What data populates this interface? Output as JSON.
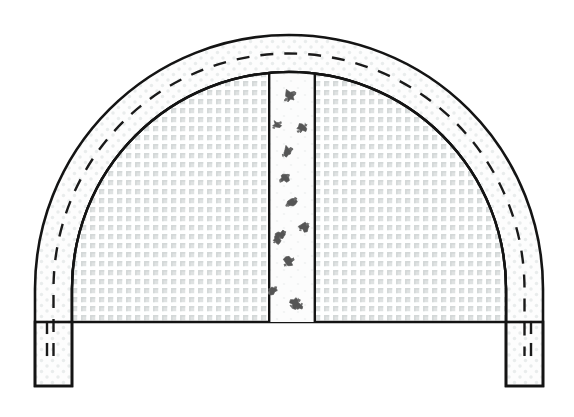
{
  "figure": {
    "title": "Tunnel Arch Cross-Section",
    "domain": "Diagram",
    "width": 574,
    "height": 417,
    "background_color": "#ffffff",
    "line_color": "#141414"
  },
  "geometry": {
    "outer_arch": {
      "name": "outer-lining-ring",
      "apex_y": 34,
      "left_outer_x": 35,
      "right_outer_x": 543,
      "left_inner_x": 72,
      "right_inner_x": 506,
      "springline_y": 322,
      "base_y": 386,
      "band_thickness": 37,
      "fill_color": "#fbfbfb",
      "stroke_width": 2.6
    },
    "dashed_centerline": {
      "name": "lining-centerline",
      "offset_from_outer": 12,
      "dash_pattern": "13 11",
      "stroke_width": 2.4,
      "color": "#1a1a1a"
    },
    "inner_core": {
      "name": "excavation-core",
      "apex_y": 72,
      "left_x": 72,
      "right_x": 506,
      "base_y": 322,
      "fill_pattern": "fine-grid-stipple",
      "pattern_color": "#d9dcdc"
    },
    "center_band": {
      "name": "central-core-band",
      "left_x": 268,
      "right_x": 316,
      "top_y": 74,
      "bottom_y": 322,
      "fill_color": "#fcfcfc",
      "stroke_width": 2.2
    },
    "left_leg": {
      "name": "left-side-wall",
      "left_x": 35,
      "right_x": 72,
      "top_y": 322,
      "bottom_y": 386
    },
    "right_leg": {
      "name": "right-side-wall",
      "left_x": 506,
      "right_x": 543,
      "top_y": 322,
      "bottom_y": 386
    }
  },
  "speckles": {
    "name": "aggregate-marks",
    "color": "#555555",
    "count": 13,
    "points": [
      {
        "cx": 290,
        "cy": 96,
        "r": 6.0,
        "rot": 12
      },
      {
        "cx": 277,
        "cy": 125,
        "r": 4.4,
        "rot": 40
      },
      {
        "cx": 302,
        "cy": 128,
        "r": 5.2,
        "rot": 75
      },
      {
        "cx": 287,
        "cy": 152,
        "r": 5.4,
        "rot": 130
      },
      {
        "cx": 284,
        "cy": 178,
        "r": 5.0,
        "rot": 25
      },
      {
        "cx": 291,
        "cy": 202,
        "r": 5.6,
        "rot": 160
      },
      {
        "cx": 304,
        "cy": 227,
        "r": 5.0,
        "rot": 55
      },
      {
        "cx": 281,
        "cy": 235,
        "r": 4.8,
        "rot": 95
      },
      {
        "cx": 277,
        "cy": 240,
        "r": 3.8,
        "rot": 10
      },
      {
        "cx": 289,
        "cy": 262,
        "r": 5.2,
        "rot": 140
      },
      {
        "cx": 272,
        "cy": 290,
        "r": 4.6,
        "rot": 70
      },
      {
        "cx": 295,
        "cy": 303,
        "r": 5.4,
        "rot": 20
      },
      {
        "cx": 299,
        "cy": 306,
        "r": 3.6,
        "rot": 110
      }
    ]
  },
  "leg_dashes": {
    "name": "leg-centerline-dashes",
    "left": [
      {
        "x": 47,
        "y1": 322,
        "y2": 334
      },
      {
        "x": 47,
        "y1": 343,
        "y2": 356
      }
    ],
    "right": [
      {
        "x": 531,
        "y1": 322,
        "y2": 334
      },
      {
        "x": 531,
        "y1": 343,
        "y2": 356
      }
    ]
  },
  "legend": {
    "items": [
      {
        "key": "outer_ring",
        "label": "Lining ring"
      },
      {
        "key": "inner_core",
        "label": "Core ground"
      },
      {
        "key": "center_band",
        "label": "Central band"
      }
    ]
  }
}
